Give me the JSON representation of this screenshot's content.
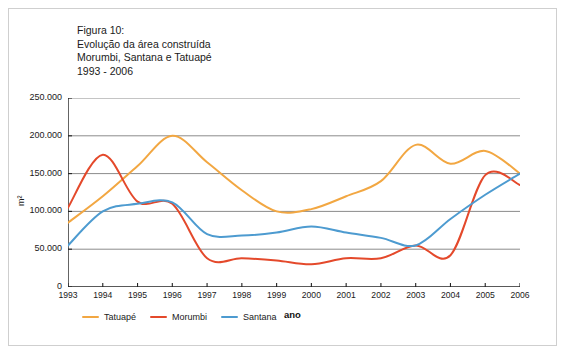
{
  "figure": {
    "title": "Figura 10:\nEvolução da área construída\nMorumbi, Santana e Tatuapé\n1993 - 2006"
  },
  "chart_data": {
    "type": "line",
    "title": "Evolução da área construída Morumbi, Santana e Tatuapé 1993 - 2006",
    "xlabel": "ano",
    "ylabel": "m²",
    "xlim": [
      1993,
      2006
    ],
    "ylim": [
      0,
      250000
    ],
    "grid": true,
    "legend_position": "bottom-left",
    "categories": [
      "1993",
      "1994",
      "1995",
      "1996",
      "1997",
      "1998",
      "1999",
      "2000",
      "2001",
      "2002",
      "2003",
      "2004",
      "2005",
      "2006"
    ],
    "x": [
      1993,
      1994,
      1995,
      1996,
      1997,
      1998,
      1999,
      2000,
      2001,
      2002,
      2003,
      2004,
      2005,
      2006
    ],
    "yticks": [
      0,
      50000,
      100000,
      150000,
      200000,
      250000
    ],
    "ytick_labels": [
      "0",
      "50.000",
      "100.000",
      "150.000",
      "200.000",
      "250.000"
    ],
    "series": [
      {
        "name": "Tatuapé",
        "color": "#F2A742",
        "values": [
          85000,
          120000,
          160000,
          200000,
          165000,
          128000,
          100000,
          103000,
          120000,
          140000,
          188000,
          163000,
          180000,
          150000
        ]
      },
      {
        "name": "Morumbi",
        "color": "#E4492B",
        "values": [
          105000,
          175000,
          113000,
          110000,
          38000,
          38000,
          35000,
          30000,
          38000,
          38000,
          55000,
          42000,
          148000,
          135000
        ]
      },
      {
        "name": "Santana",
        "color": "#4D9BD0",
        "values": [
          55000,
          100000,
          110000,
          112000,
          70000,
          68000,
          72000,
          80000,
          72000,
          65000,
          55000,
          90000,
          122000,
          150000
        ]
      }
    ]
  },
  "axes": {
    "y_title": "m²",
    "x_title": "ano"
  },
  "legend": {
    "items": [
      {
        "label": "Tatuapé",
        "color": "#F2A742"
      },
      {
        "label": "Morumbi",
        "color": "#E4492B"
      },
      {
        "label": "Santana",
        "color": "#4D9BD0"
      }
    ]
  }
}
